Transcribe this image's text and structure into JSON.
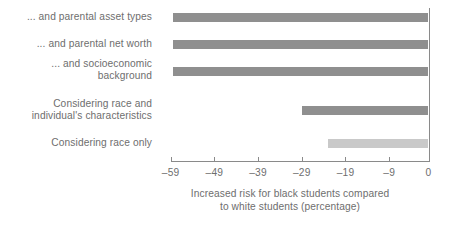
{
  "chart_data": {
    "type": "bar",
    "orientation": "horizontal",
    "title": "",
    "subtitle": "",
    "xlabel": "Increased risk for black students compared\nto white students (percentage)",
    "ylabel": "",
    "categories": [
      "... and parental asset types",
      "... and parental net worth",
      "... and socioeconomic\nbackground",
      "Considering race and\nindividual's characteristics",
      "Considering race only"
    ],
    "values": [
      -58.5,
      -58.5,
      -58.5,
      -29,
      -23
    ],
    "xlim": [
      -63,
      0
    ],
    "xticks": [
      -59,
      -49,
      -39,
      -29,
      -19,
      -9,
      0
    ],
    "xtick_labels": [
      "–59",
      "–49",
      "–39",
      "–29",
      "–19",
      "–9",
      "0"
    ],
    "grid": false,
    "legend": "none",
    "bar_colors": [
      "#8f8f8f",
      "#8f8f8f",
      "#8f8f8f",
      "#8f8f8f",
      "#c9c9c9"
    ],
    "series": [
      {
        "name": "Increased risk for black students compared to white students (percentage)",
        "values": [
          -58.5,
          -58.5,
          -58.5,
          -29,
          -23
        ]
      }
    ]
  },
  "colors": {
    "bar_dark": "#8f8f8f",
    "bar_light": "#c9c9c9",
    "axis": "#8a8a8a",
    "text": "#6e6e6e",
    "background": "#ffffff"
  },
  "caption": {
    "line1": "Increased risk for black students compared",
    "line2": "to white students (percentage)"
  }
}
